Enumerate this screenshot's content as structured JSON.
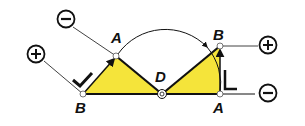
{
  "diagram": {
    "labels": {
      "left_b": "B",
      "top_a": "A",
      "center_d": "D",
      "right_b": "B",
      "right_a": "A"
    },
    "signs": {
      "left_plus": "+",
      "top_minus": "−",
      "right_plus": "+",
      "right_minus": "−"
    },
    "colors": {
      "fill": "#f5e43a",
      "stroke": "#111111",
      "background": "#ffffff"
    }
  }
}
